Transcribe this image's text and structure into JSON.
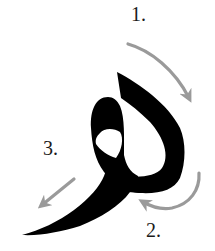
{
  "diagram": {
    "type": "stroke-order",
    "glyph": "وٍ",
    "steps": [
      {
        "label": "1.",
        "direction": "clockwise curve down-right"
      },
      {
        "label": "2.",
        "direction": "curve from right back to left"
      },
      {
        "label": "3.",
        "direction": "straight down-left"
      }
    ],
    "colors": {
      "glyph": "#000000",
      "arrow": "#9a9a9a",
      "text": "#1a1a1a",
      "background": "#ffffff"
    }
  }
}
